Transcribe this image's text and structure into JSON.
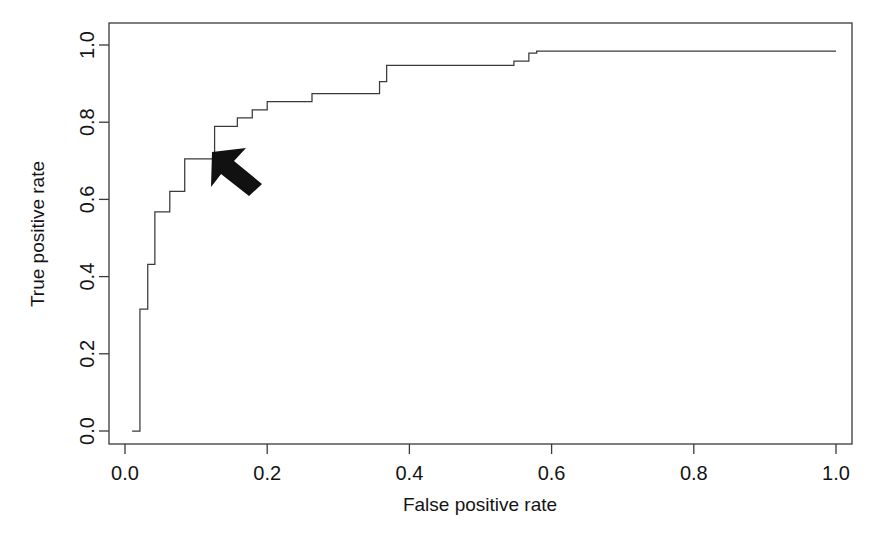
{
  "figure": {
    "background_color": "#ffffff",
    "line_color": "#3a3a3a",
    "text_color": "#141414",
    "cursor": {
      "name": "mouse-pointer-arrow",
      "tip_x": 0.112,
      "tip_y": 0.682
    }
  },
  "chart_data": {
    "type": "line",
    "title": "",
    "subtitle": "",
    "xlabel": "False positive rate",
    "ylabel": "True positive rate",
    "xlim": [
      0.0,
      1.0
    ],
    "ylim": [
      0.0,
      1.0
    ],
    "grid": false,
    "legend": null,
    "legend_position": "none",
    "xticks": [
      0.0,
      0.2,
      0.4,
      0.6,
      0.8,
      1.0
    ],
    "xtick_labels": [
      "0.0",
      "0.2",
      "0.4",
      "0.6",
      "0.8",
      "1.0"
    ],
    "yticks": [
      0.0,
      0.2,
      0.4,
      0.6,
      0.8,
      1.0
    ],
    "ytick_labels": [
      "0.0",
      "0.2",
      "0.4",
      "0.6",
      "0.8",
      "1.0"
    ],
    "annotations": [],
    "series": [
      {
        "name": "ROC curve",
        "drawstyle": "steps-post",
        "x": [
          0.01,
          0.021,
          0.021,
          0.032,
          0.032,
          0.042,
          0.042,
          0.063,
          0.063,
          0.084,
          0.084,
          0.105,
          0.105,
          0.126,
          0.126,
          0.158,
          0.158,
          0.179,
          0.179,
          0.2,
          0.2,
          0.232,
          0.232,
          0.263,
          0.263,
          0.305,
          0.305,
          0.358,
          0.358,
          0.368,
          0.368,
          0.547,
          0.547,
          0.568,
          0.568,
          0.579,
          0.579,
          1.0
        ],
        "y": [
          0.0,
          0.0,
          0.316,
          0.316,
          0.432,
          0.432,
          0.568,
          0.568,
          0.621,
          0.621,
          0.705,
          0.705,
          0.705,
          0.705,
          0.789,
          0.789,
          0.811,
          0.811,
          0.832,
          0.832,
          0.853,
          0.853,
          0.853,
          0.853,
          0.874,
          0.874,
          0.874,
          0.874,
          0.905,
          0.905,
          0.947,
          0.947,
          0.958,
          0.958,
          0.979,
          0.979,
          0.984,
          0.984
        ]
      }
    ]
  }
}
